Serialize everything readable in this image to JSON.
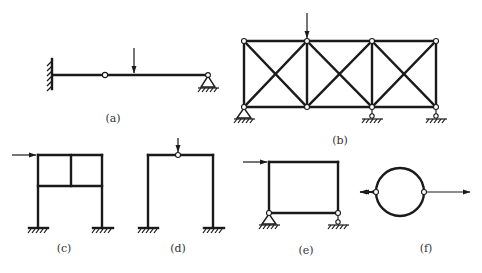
{
  "figure": {
    "panels": [
      {
        "id": "a",
        "label": "(a)",
        "description": "Cantilever beam with intermediate hinge, vertical point load, pinned support at right end"
      },
      {
        "id": "b",
        "label": "(b)",
        "description": "Three-bay cross-braced truss with vertical load at top joint, pin support left, roller supports at two right joints"
      },
      {
        "id": "c",
        "label": "(c)",
        "description": "Two-storey frame with internal vertical member, horizontal load at top-left, fixed bases"
      },
      {
        "id": "d",
        "label": "(d)",
        "description": "Portal frame with hinge at mid-span of beam, vertical load at hinge, fixed bases"
      },
      {
        "id": "e",
        "label": "(e)",
        "description": "Closed rectangular frame, horizontal load at top-left, pin support left, roller support right"
      },
      {
        "id": "f",
        "label": "(f)",
        "description": "Circular ring with two hinges on horizontal diameter, opposing tensile forces"
      }
    ],
    "colors": {
      "line": "#1a1a1a",
      "label": "#333333",
      "background": "#ffffff"
    }
  }
}
